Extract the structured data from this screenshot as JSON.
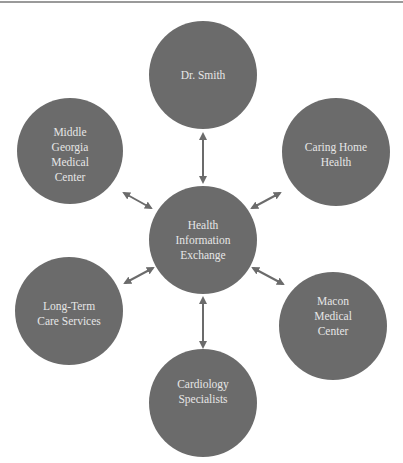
{
  "diagram": {
    "type": "hub-and-spoke",
    "colors": {
      "node_fill": "#6b6b6b",
      "node_text": "#e6e6e6",
      "arrow": "#6b6b6b",
      "top_rule": "#9a9a9a",
      "background": "#ffffff"
    },
    "hub": {
      "id": "hie",
      "lines": [
        "Health",
        "Information",
        "Exchange"
      ]
    },
    "nodes": [
      {
        "id": "dr-smith",
        "position": "top",
        "lines": [
          "Dr. Smith"
        ]
      },
      {
        "id": "caring-home-health",
        "position": "upper-right",
        "lines": [
          "Caring Home",
          "Health"
        ]
      },
      {
        "id": "macon-medical-center",
        "position": "lower-right",
        "lines": [
          "Macon",
          "Medical",
          "Center"
        ]
      },
      {
        "id": "cardiology-specialists",
        "position": "bottom",
        "lines": [
          "Cardiology",
          "Specialists"
        ]
      },
      {
        "id": "long-term-care-services",
        "position": "lower-left",
        "lines": [
          "Long-Term",
          "Care Services"
        ]
      },
      {
        "id": "middle-georgia-medical-center",
        "position": "upper-left",
        "lines": [
          "Middle",
          "Georgia",
          "Medical",
          "Center"
        ]
      }
    ],
    "edges": [
      {
        "from": "hie",
        "to": "dr-smith",
        "bidirectional": true
      },
      {
        "from": "hie",
        "to": "caring-home-health",
        "bidirectional": true
      },
      {
        "from": "hie",
        "to": "macon-medical-center",
        "bidirectional": true
      },
      {
        "from": "hie",
        "to": "cardiology-specialists",
        "bidirectional": true
      },
      {
        "from": "hie",
        "to": "long-term-care-services",
        "bidirectional": true
      },
      {
        "from": "hie",
        "to": "middle-georgia-medical-center",
        "bidirectional": true
      }
    ]
  }
}
